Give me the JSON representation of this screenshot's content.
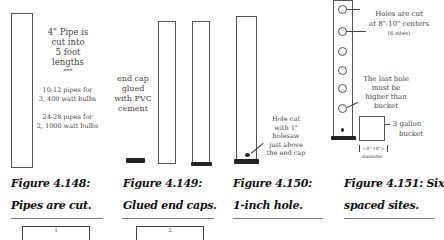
{
  "figures": [
    {
      "id": "4.148",
      "caption_line1": "Figure 4.148:",
      "caption_line2": "Pipes are cut.",
      "notes": {
        "main": [
          "4\" Pipe is",
          "cut into",
          "5 foot",
          "lengths"
        ],
        "separator": "***",
        "group1": [
          "10-12 pipes for",
          "3, 400 watt bulbs"
        ],
        "group2": [
          "24-28 pipes for",
          "2, 1000 watt bulbs"
        ]
      },
      "box_label": "1"
    },
    {
      "id": "4.149",
      "caption_line1": "Figure 4.149:",
      "caption_line2": "Glued end caps.",
      "notes": {
        "main": [
          "end cap",
          "glued",
          "with PVC",
          "cement"
        ]
      },
      "box_label": "2"
    },
    {
      "id": "4.150",
      "caption_line1": "Figure 4.150:",
      "caption_line2": "1-inch hole.",
      "notes": {
        "main": [
          "Hole cut",
          "with 1\"",
          "holesaw",
          "just above",
          "the end cap"
        ]
      }
    },
    {
      "id": "4.151",
      "caption_line1": "Figure 4.151: Six",
      "caption_line2": "spaced sites.",
      "notes": {
        "holes": [
          "Holes are cut",
          "at 8\"-10\" centers"
        ],
        "sites": "(6 sites)",
        "last_hole": [
          "The last hole",
          "must be",
          "higher than",
          "bucket"
        ],
        "bucket": [
          "3 gallon",
          "bucket"
        ],
        "diameter_value": "<8\"-10\">",
        "diameter_label": "diameter"
      }
    }
  ]
}
